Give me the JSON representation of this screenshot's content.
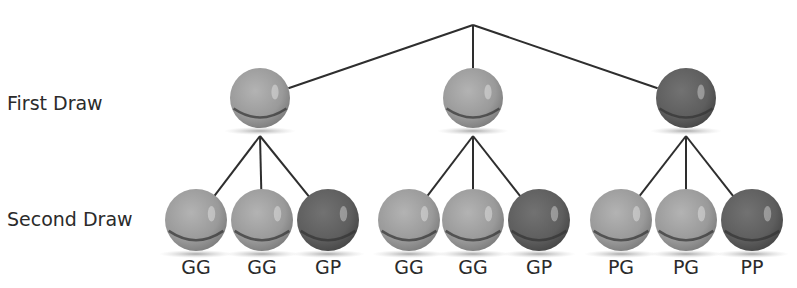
{
  "diagram": {
    "title": "",
    "row_labels": {
      "first": "First Draw",
      "second": "Second Draw"
    },
    "colors": {
      "green_marble": "#9a9a9a",
      "purple_marble": "#5e5e5e",
      "line": "#2e2e2e",
      "text": "#2b2b2b"
    },
    "root": {
      "x": 473,
      "y": 25
    },
    "first_draw": [
      {
        "color": "G",
        "x": 260
      },
      {
        "color": "G",
        "x": 473
      },
      {
        "color": "P",
        "x": 686
      }
    ],
    "second_draw": [
      {
        "parent": 0,
        "color": "G",
        "x": 196,
        "label": "GG"
      },
      {
        "parent": 0,
        "color": "G",
        "x": 262,
        "label": "GG"
      },
      {
        "parent": 0,
        "color": "P",
        "x": 328,
        "label": "GP"
      },
      {
        "parent": 1,
        "color": "G",
        "x": 409,
        "label": "GG"
      },
      {
        "parent": 1,
        "color": "G",
        "x": 473,
        "label": "GG"
      },
      {
        "parent": 1,
        "color": "P",
        "x": 539,
        "label": "GP"
      },
      {
        "parent": 2,
        "color": "G",
        "x": 621,
        "label": "PG"
      },
      {
        "parent": 2,
        "color": "G",
        "x": 686,
        "label": "PG"
      },
      {
        "parent": 2,
        "color": "P",
        "x": 752,
        "label": "PP"
      }
    ]
  }
}
